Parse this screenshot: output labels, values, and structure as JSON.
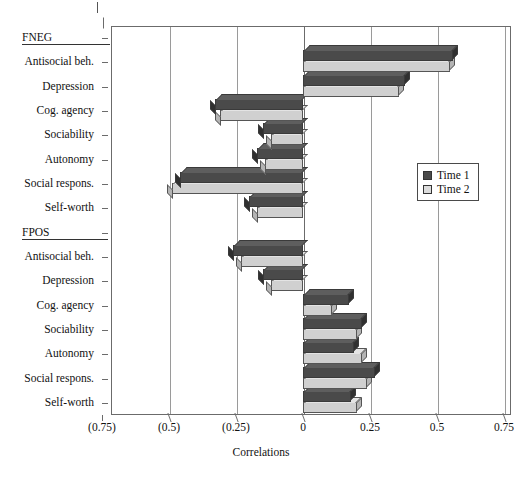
{
  "chart_data": {
    "type": "bar",
    "orientation": "horizontal",
    "title": "",
    "xlabel": "Correlations",
    "ylabel": "",
    "xlim": [
      -0.75,
      0.75
    ],
    "xticks": [
      -0.75,
      -0.5,
      -0.25,
      0,
      0.25,
      0.5,
      0.75
    ],
    "xticklabels": [
      "(0.75)",
      "(0.5)",
      "(0.25)",
      "0",
      "0.25",
      "0.5",
      "0.75"
    ],
    "grid": true,
    "legend_position": "right-middle",
    "legend": [
      "Time 1",
      "Time 2"
    ],
    "groups": [
      {
        "name": "FNEG",
        "categories": [
          "Antisocial beh.",
          "Depression",
          "Cog. agency",
          "Sociability",
          "Autonomy",
          "Social respons.",
          "Self-worth"
        ],
        "series": [
          {
            "name": "Time 1",
            "values": [
              0.56,
              0.38,
              -0.33,
              -0.15,
              -0.17,
              -0.46,
              -0.2
            ]
          },
          {
            "name": "Time 2",
            "values": [
              0.55,
              0.36,
              -0.31,
              -0.12,
              -0.14,
              -0.49,
              -0.17
            ]
          }
        ]
      },
      {
        "name": "FPOS",
        "categories": [
          "Antisocial beh.",
          "Depression",
          "Cog. agency",
          "Sociability",
          "Autonomy",
          "Social respons.",
          "Self-worth"
        ],
        "series": [
          {
            "name": "Time 1",
            "values": [
              -0.26,
              -0.15,
              0.17,
              0.22,
              0.19,
              0.27,
              0.18
            ]
          },
          {
            "name": "Time 2",
            "values": [
              -0.23,
              -0.12,
              0.11,
              0.2,
              0.22,
              0.24,
              0.2
            ]
          }
        ]
      }
    ]
  },
  "axis": {
    "x_title": "Correlations",
    "ticklabels": [
      "(0.75)",
      "(0.5)",
      "(0.25)",
      "0",
      "0.25",
      "0.5",
      "0.75"
    ]
  },
  "y_axis": {
    "rows": [
      {
        "label": "FNEG",
        "kind": "group"
      },
      {
        "label": "Antisocial beh.",
        "kind": "item"
      },
      {
        "label": "Depression",
        "kind": "item"
      },
      {
        "label": "Cog. agency",
        "kind": "item"
      },
      {
        "label": "Sociability",
        "kind": "item"
      },
      {
        "label": "Autonomy",
        "kind": "item"
      },
      {
        "label": "Social respons.",
        "kind": "item"
      },
      {
        "label": "Self-worth",
        "kind": "item"
      },
      {
        "label": "FPOS",
        "kind": "group"
      },
      {
        "label": "Antisocial beh.",
        "kind": "item"
      },
      {
        "label": "Depression",
        "kind": "item"
      },
      {
        "label": "Cog. agency",
        "kind": "item"
      },
      {
        "label": "Sociability",
        "kind": "item"
      },
      {
        "label": "Autonomy",
        "kind": "item"
      },
      {
        "label": "Social respons.",
        "kind": "item"
      },
      {
        "label": "Self-worth",
        "kind": "item"
      }
    ]
  },
  "legend": {
    "items": [
      {
        "label": "Time 1",
        "color": "#4a4a4a"
      },
      {
        "label": "Time 2",
        "color": "#dcdcdc"
      }
    ]
  },
  "colors": {
    "time1": "#4a4a4a",
    "time2": "#dcdcdc",
    "axis": "#6b6b6b",
    "grid": "#9a9a9a"
  }
}
